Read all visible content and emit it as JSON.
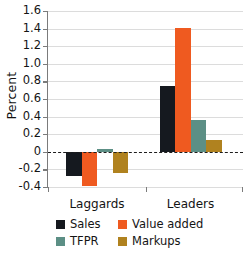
{
  "chart_data": {
    "type": "bar",
    "title": "",
    "xlabel": "",
    "ylabel": "Percent",
    "categories": [
      "Laggards",
      "Leaders"
    ],
    "series": [
      {
        "name": "Sales",
        "color": "#15191f",
        "values": [
          -0.28,
          0.75
        ]
      },
      {
        "name": "Value added",
        "color": "#ef5a20",
        "values": [
          -0.39,
          1.41
        ]
      },
      {
        "name": "TFPR",
        "color": "#5c8f85",
        "values": [
          0.03,
          0.36
        ]
      },
      {
        "name": "Markups",
        "color": "#b0821f",
        "values": [
          -0.24,
          0.13
        ]
      }
    ],
    "ylim": [
      -0.4,
      1.6
    ],
    "yticks": [
      "1.6",
      "1.4",
      "1.2",
      "1.0",
      "0.8",
      "0.6",
      "0.4",
      "0.2",
      "0",
      "-0.2",
      "-0.4"
    ],
    "ytick_values": [
      1.6,
      1.4,
      1.2,
      1.0,
      0.8,
      0.6,
      0.4,
      0.2,
      0,
      -0.2,
      -0.4
    ],
    "grid": true,
    "zero_line": true,
    "legend_position": "bottom"
  },
  "legend": {
    "entries": [
      {
        "label": "Sales",
        "color": "#15191f"
      },
      {
        "label": "Value added",
        "color": "#ef5a20"
      },
      {
        "label": "TFPR",
        "color": "#5c8f85"
      },
      {
        "label": "Markups",
        "color": "#b0821f"
      }
    ]
  },
  "axis": {
    "y_title": "Percent",
    "x_categories": [
      "Laggards",
      "Leaders"
    ]
  }
}
